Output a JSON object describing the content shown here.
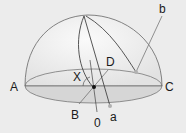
{
  "diagram": {
    "labels": {
      "A": "A",
      "B": "B",
      "C": "C",
      "D": "D",
      "X": "X",
      "O": "0",
      "a": "a",
      "b": "b"
    },
    "colors": {
      "background": "#ececec",
      "dome_fill": "#f4f4f4",
      "horizon_fill": "#dcdcdc",
      "line": "#555555",
      "marker": "#b0b0b0",
      "center_dot": "#111111"
    }
  }
}
